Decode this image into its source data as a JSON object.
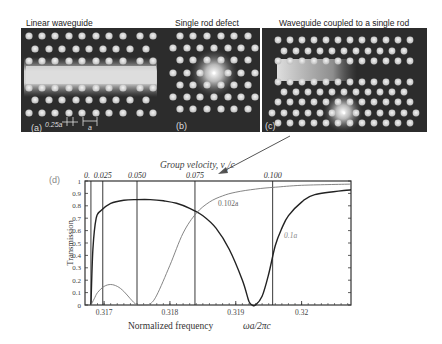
{
  "panels": {
    "a": {
      "title": "Linear waveguide",
      "label": "(a)",
      "dim_small": "0.25a",
      "dim_large": "a"
    },
    "b": {
      "title": "Single rod defect",
      "label": "(b)"
    },
    "c": {
      "title": "Waveguide coupled to a single rod",
      "label": "(c)"
    },
    "d": {
      "label": "(d)"
    }
  },
  "chart_data": {
    "type": "line",
    "title": "",
    "top_axis_title": "Group velocity, v_g/c",
    "top_axis_title_main": "Group velocity,",
    "top_axis_title_var": "v",
    "top_axis_title_sub": "g",
    "top_axis_title_tail": "/c",
    "top_axis_ticks": [
      {
        "label": "0.",
        "x": 0.3168
      },
      {
        "label": "0.025",
        "x": 0.31698
      },
      {
        "label": "0.050",
        "x": 0.3175
      },
      {
        "label": "0.075",
        "x": 0.31838
      },
      {
        "label": "0.100",
        "x": 0.31956
      }
    ],
    "xlabel": "Normalized frequency",
    "xlabel_var": "ωa/2πc",
    "ylabel": "Transmission",
    "xlim": [
      0.31671,
      0.32075
    ],
    "ylim": [
      0,
      1
    ],
    "x_ticks": [
      "0.317",
      "0.318",
      "0.319",
      "0.32"
    ],
    "x_tick_values": [
      0.317,
      0.318,
      0.319,
      0.32
    ],
    "y_ticks": [
      "0",
      "0.1",
      "0.2",
      "0.3",
      "0.4",
      "0.5",
      "0.6",
      "0.7",
      "0.8",
      "0.9",
      "1"
    ],
    "y_tick_values": [
      0,
      0.1,
      0.2,
      0.3,
      0.4,
      0.5,
      0.6,
      0.7,
      0.8,
      0.9,
      1.0
    ],
    "grid": false,
    "annotations": [
      "0.102a",
      "0.1a"
    ],
    "series": [
      {
        "name": "0.1a",
        "color": "#222222",
        "x": [
          0.3168,
          0.31683,
          0.31688,
          0.31695,
          0.3171,
          0.3173,
          0.3175,
          0.3177,
          0.3179,
          0.3181,
          0.3183,
          0.3185,
          0.3187,
          0.3189,
          0.3191,
          0.3192,
          0.31925,
          0.3193,
          0.3194,
          0.3195,
          0.3196,
          0.3197,
          0.3198,
          0.32,
          0.3202,
          0.32075
        ],
        "y": [
          0.0,
          0.45,
          0.7,
          0.76,
          0.82,
          0.845,
          0.85,
          0.85,
          0.84,
          0.82,
          0.78,
          0.72,
          0.62,
          0.45,
          0.2,
          0.03,
          0.0,
          0.0,
          0.07,
          0.25,
          0.48,
          0.62,
          0.72,
          0.83,
          0.89,
          0.93
        ]
      },
      {
        "name": "0.102a",
        "color": "#777777",
        "x": [
          0.3168,
          0.31685,
          0.3169,
          0.317,
          0.3171,
          0.3172,
          0.3173,
          0.3174,
          0.3175,
          0.3176,
          0.3177,
          0.3178,
          0.318,
          0.3182,
          0.3184,
          0.3186,
          0.3188,
          0.319,
          0.3193,
          0.3196,
          0.32,
          0.32075
        ],
        "y": [
          0.0,
          0.05,
          0.1,
          0.15,
          0.165,
          0.15,
          0.11,
          0.05,
          0.0,
          0.0,
          0.01,
          0.08,
          0.32,
          0.58,
          0.74,
          0.83,
          0.88,
          0.91,
          0.935,
          0.95,
          0.965,
          0.975
        ]
      }
    ]
  },
  "arrow": {
    "from": [
      290,
      135
    ],
    "to": [
      218,
      174
    ]
  }
}
